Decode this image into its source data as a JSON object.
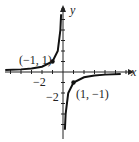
{
  "chart_data": {
    "type": "line",
    "title": "",
    "function": "y = -1/x",
    "xlabel": "x",
    "ylabel": "y",
    "xlim": [
      -6,
      6
    ],
    "ylim": [
      -6,
      6
    ],
    "tick_labels": {
      "x": [
        "-2"
      ],
      "y": [
        "-2"
      ]
    },
    "annotations": [
      {
        "label": "(-1, 1)",
        "x": -1,
        "y": 1
      },
      {
        "label": "(1, -1)",
        "x": 1,
        "y": -1
      }
    ],
    "series": [
      {
        "name": "left branch",
        "x": [
          -5.5,
          -4,
          -3,
          -2,
          -1,
          -0.5,
          -0.25,
          -0.18
        ],
        "y": [
          0.18,
          0.25,
          0.33,
          0.5,
          1,
          2,
          4,
          5.5
        ]
      },
      {
        "name": "right branch",
        "x": [
          0.18,
          0.25,
          0.5,
          1,
          2,
          3,
          4,
          5.5
        ],
        "y": [
          -5.5,
          -4,
          -2,
          -1,
          -0.5,
          -0.33,
          -0.25,
          -0.18
        ]
      }
    ],
    "grid": false
  },
  "labels": {
    "x_axis": "x",
    "y_axis": "y",
    "x_tick": "−2",
    "y_tick": "−2",
    "point_a": "(−1, 1)",
    "point_b": "(1, −1)"
  }
}
